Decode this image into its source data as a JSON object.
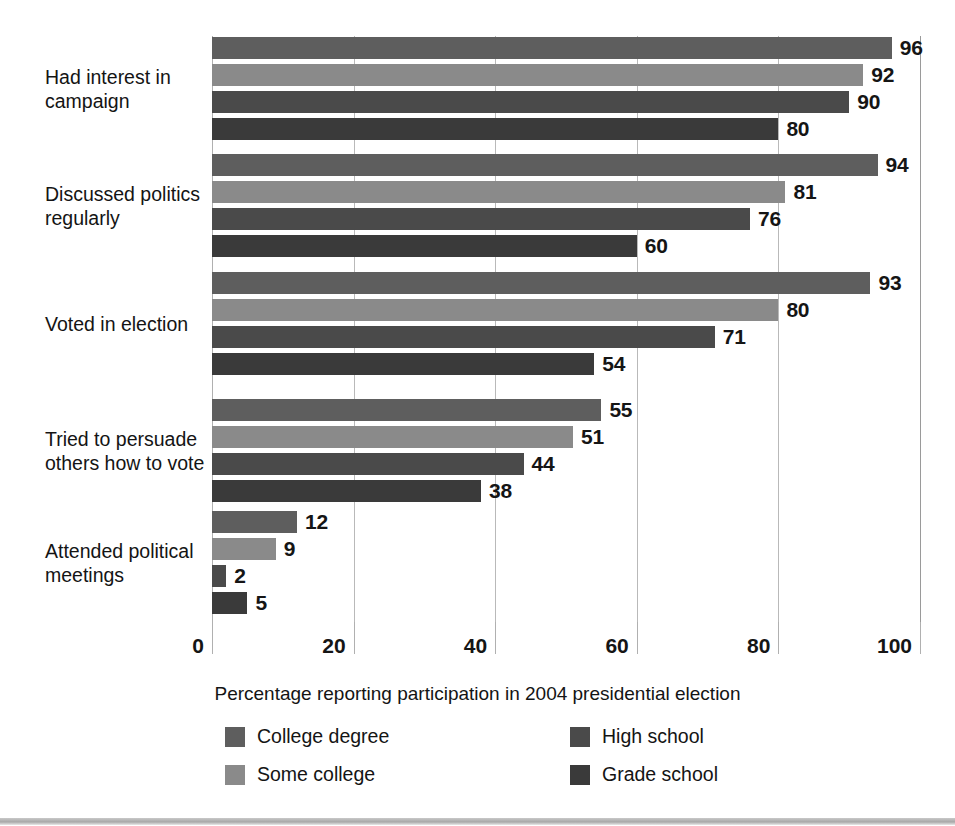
{
  "chart_data": {
    "type": "bar",
    "orientation": "horizontal",
    "title": "",
    "xlabel": "Percentage reporting participation in 2004 presidential election",
    "ylabel": "",
    "xlim": [
      0,
      100
    ],
    "xticks": [
      0,
      20,
      40,
      60,
      80,
      100
    ],
    "xtick_labels": [
      "0",
      "20",
      "40",
      "60",
      "80",
      "100"
    ],
    "grid": true,
    "legend_position": "bottom",
    "categories": [
      "Had interest in campaign",
      "Discussed politics regularly",
      "Voted in election",
      "Tried to persuade others how to vote",
      "Attended political meetings"
    ],
    "category_label_lines": [
      [
        "Had interest in",
        "campaign"
      ],
      [
        "Discussed politics",
        "regularly"
      ],
      [
        "Voted in election"
      ],
      [
        "Tried to persuade",
        "others how to vote"
      ],
      [
        "Attended political",
        "meetings"
      ]
    ],
    "series": [
      {
        "name": "College degree",
        "color": "#5e5e5e",
        "values": [
          96,
          94,
          93,
          55,
          12
        ]
      },
      {
        "name": "Some college",
        "color": "#8a8a8a",
        "values": [
          92,
          81,
          80,
          51,
          9
        ]
      },
      {
        "name": "High school",
        "color": "#4a4a4a",
        "values": [
          90,
          76,
          71,
          44,
          2
        ]
      },
      {
        "name": "Grade school",
        "color": "#3a3a3a",
        "values": [
          80,
          60,
          54,
          38,
          5
        ]
      }
    ]
  },
  "legend": {
    "items": [
      {
        "label": "College degree",
        "color": "#5e5e5e"
      },
      {
        "label": "Some college",
        "color": "#8a8a8a"
      },
      {
        "label": "High school",
        "color": "#4a4a4a"
      },
      {
        "label": "Grade school",
        "color": "#3a3a3a"
      }
    ]
  }
}
